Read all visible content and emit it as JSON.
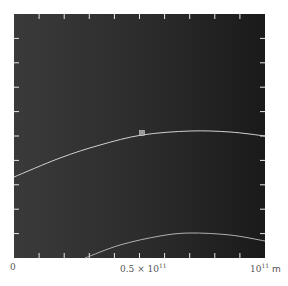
{
  "chart_data": {
    "type": "line",
    "title": "",
    "xlabel": "m",
    "ylabel": "",
    "x_ticks": [
      "0",
      "0.5 × 10^11",
      "10^11 m"
    ],
    "xlim": [
      0,
      100000000000.0
    ],
    "grid": false,
    "background": "#2e2e2e",
    "series": [
      {
        "name": "upper-orbit-arc",
        "color": "#d0d0d0",
        "points_px": [
          [
            14,
            177
          ],
          [
            60,
            158
          ],
          [
            100,
            145
          ],
          [
            142,
            135
          ],
          [
            190,
            131
          ],
          [
            230,
            132
          ],
          [
            265,
            136
          ]
        ]
      },
      {
        "name": "lower-orbit-arc",
        "color": "#b0b0b0",
        "points_px": [
          [
            85,
            258
          ],
          [
            120,
            245
          ],
          [
            160,
            236
          ],
          [
            190,
            233
          ],
          [
            230,
            235
          ],
          [
            265,
            241
          ]
        ]
      }
    ],
    "markers": [
      {
        "name": "central-body",
        "x_px": 142,
        "y_px": 133,
        "color": "#9a9a9a"
      }
    ]
  },
  "axis": {
    "label_zero": "0",
    "label_mid_base": "0.5 × 10",
    "label_mid_exp": "11",
    "label_end_base": "10",
    "label_end_exp": "11",
    "label_unit": "m"
  }
}
